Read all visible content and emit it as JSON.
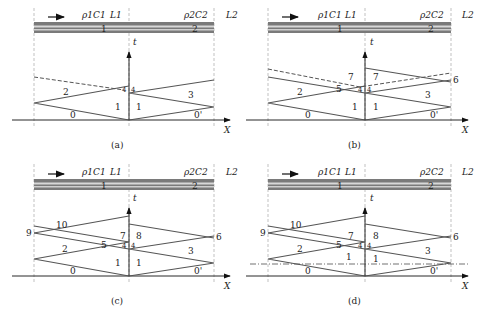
{
  "figure": {
    "panels": [
      {
        "id": "a",
        "caption": "(a)",
        "bar": {
          "rod1_label": "ρ1C1",
          "L1": "L1",
          "rod2_label": "ρ2C2",
          "L2": "L2",
          "seg1": "1",
          "seg2": "2"
        },
        "axes": {
          "t": "t",
          "x": "X"
        },
        "regions": [
          "0",
          "0'",
          "1",
          "1",
          "2",
          "3",
          "4",
          "4"
        ]
      },
      {
        "id": "b",
        "caption": "(b)",
        "bar": {
          "rod1_label": "ρ1C1",
          "L1": "L1",
          "rod2_label": "ρ2C2",
          "L2": "L2",
          "seg1": "1",
          "seg2": "2"
        },
        "axes": {
          "t": "t",
          "x": "X"
        },
        "regions": [
          "0",
          "0'",
          "1",
          "1",
          "2",
          "3",
          "4",
          "4",
          "5",
          "6",
          "7",
          "7"
        ]
      },
      {
        "id": "c",
        "caption": "(c)",
        "bar": {
          "rod1_label": "ρ1C1",
          "L1": "L1",
          "rod2_label": "ρ2C2",
          "L2": "L2",
          "seg1": "1",
          "seg2": "2"
        },
        "axes": {
          "t": "t",
          "x": "X"
        },
        "regions": [
          "0",
          "0'",
          "1",
          "1",
          "2",
          "3",
          "4",
          "4",
          "5",
          "6",
          "7",
          "8",
          "9",
          "10"
        ]
      },
      {
        "id": "d",
        "caption": "(d)",
        "bar": {
          "rod1_label": "ρ1C1",
          "L1": "L1",
          "rod2_label": "ρ2C2",
          "L2": "L2",
          "seg1": "1",
          "seg2": "2"
        },
        "axes": {
          "t": "t",
          "x": "X"
        },
        "regions": [
          "0",
          "0'",
          "1",
          "1",
          "2",
          "3",
          "4",
          "4",
          "5",
          "6",
          "7",
          "8",
          "9",
          "10"
        ]
      }
    ],
    "colors": {
      "wave_line": "#555555",
      "bar_dark": "#7a7a7a",
      "bar_light": "#d8d8d8",
      "axis": "#111111"
    }
  }
}
